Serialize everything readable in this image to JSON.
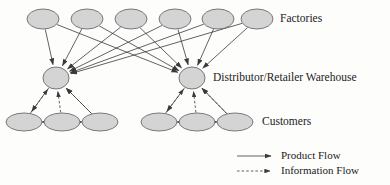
{
  "diagram": {
    "background": "#fdfdfc",
    "node_fill": "#d4d4d4",
    "node_stroke": "#6b6b6b",
    "edge_color": "#3a3a3a",
    "text_color": "#1b1b1b"
  },
  "labels": {
    "factories": "Factories",
    "warehouse": "Distributor/Retailer Warehouse",
    "customers": "Customers"
  },
  "legend": {
    "items": [
      {
        "label": "Product Flow",
        "style": "solid"
      },
      {
        "label": "Information Flow",
        "style": "dashed"
      }
    ]
  },
  "chart_data": {
    "type": "diagram",
    "layout": "layered-network",
    "layers": [
      {
        "name": "Factories",
        "label": "Factories",
        "label_x": 280,
        "label_y": 18,
        "node_rx": 16,
        "node_ry": 10,
        "nodes": [
          {
            "id": "F1",
            "x": 43,
            "y": 19
          },
          {
            "id": "F2",
            "x": 87,
            "y": 19
          },
          {
            "id": "F3",
            "x": 131,
            "y": 19
          },
          {
            "id": "F4",
            "x": 175,
            "y": 19
          },
          {
            "id": "F5",
            "x": 218,
            "y": 19
          },
          {
            "id": "F6",
            "x": 257,
            "y": 19
          }
        ]
      },
      {
        "name": "Warehouses",
        "label": "Distributor/Retailer Warehouse",
        "label_x": 213,
        "label_y": 78,
        "node_rx": 13,
        "node_ry": 11,
        "nodes": [
          {
            "id": "W1",
            "x": 56,
            "y": 78
          },
          {
            "id": "W2",
            "x": 192,
            "y": 78
          }
        ]
      },
      {
        "name": "Customers",
        "label": "Customers",
        "label_x": 262,
        "label_y": 122,
        "node_rx": 18,
        "node_ry": 9,
        "nodes": [
          {
            "id": "C1",
            "x": 24,
            "y": 122
          },
          {
            "id": "C2",
            "x": 62,
            "y": 122
          },
          {
            "id": "C3",
            "x": 100,
            "y": 122
          },
          {
            "id": "C4",
            "x": 159,
            "y": 122
          },
          {
            "id": "C5",
            "x": 197,
            "y": 122
          },
          {
            "id": "C6",
            "x": 235,
            "y": 122
          }
        ]
      }
    ],
    "edges": [
      {
        "from": "F1",
        "to": "W1",
        "style": "solid"
      },
      {
        "from": "F2",
        "to": "W1",
        "style": "solid"
      },
      {
        "from": "F3",
        "to": "W1",
        "style": "solid"
      },
      {
        "from": "F4",
        "to": "W1",
        "style": "solid"
      },
      {
        "from": "F5",
        "to": "W1",
        "style": "solid"
      },
      {
        "from": "F6",
        "to": "W1",
        "style": "solid"
      },
      {
        "from": "F1",
        "to": "W2",
        "style": "solid"
      },
      {
        "from": "F2",
        "to": "W2",
        "style": "solid"
      },
      {
        "from": "F3",
        "to": "W2",
        "style": "solid"
      },
      {
        "from": "F4",
        "to": "W2",
        "style": "solid"
      },
      {
        "from": "F5",
        "to": "W2",
        "style": "solid"
      },
      {
        "from": "F6",
        "to": "W2",
        "style": "solid"
      },
      {
        "from": "W1",
        "to": "C1",
        "style": "solid"
      },
      {
        "from": "C1",
        "to": "W1",
        "style": "dashed"
      },
      {
        "from": "C2",
        "to": "W1",
        "style": "dashed"
      },
      {
        "from": "C3",
        "to": "W1",
        "style": "dashed"
      },
      {
        "from": "C3",
        "to": "W1",
        "style": "solid"
      },
      {
        "from": "C1",
        "to": "C2",
        "style": "solid"
      },
      {
        "from": "C3",
        "to": "C2",
        "style": "solid"
      },
      {
        "from": "W2",
        "to": "C4",
        "style": "solid"
      },
      {
        "from": "C4",
        "to": "W2",
        "style": "dashed"
      },
      {
        "from": "C5",
        "to": "W2",
        "style": "dashed"
      },
      {
        "from": "C6",
        "to": "W2",
        "style": "dashed"
      },
      {
        "from": "C6",
        "to": "W2",
        "style": "solid"
      },
      {
        "from": "C4",
        "to": "C5",
        "style": "solid"
      },
      {
        "from": "C6",
        "to": "C5",
        "style": "solid"
      }
    ],
    "legend": {
      "x": 237,
      "entries": [
        {
          "label": "Product Flow",
          "style": "solid",
          "y": 156
        },
        {
          "label": "Information Flow",
          "style": "dashed",
          "y": 171
        }
      ]
    }
  }
}
